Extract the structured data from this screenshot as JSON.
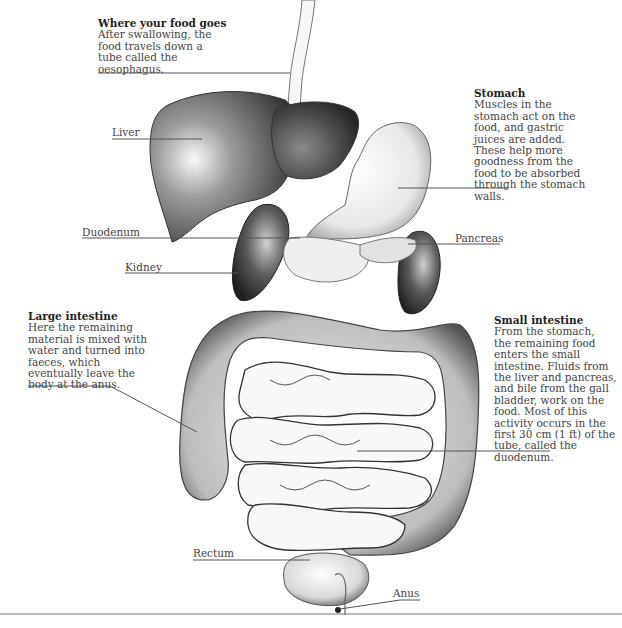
{
  "diagram": {
    "callouts": {
      "food": {
        "title": "Where your food goes",
        "body": "After swallowing, the\nfood travels down a\ntube called the\noesophagus."
      },
      "stomach": {
        "title": "Stomach",
        "body": "Muscles in the\nstomach act on the\nfood, and gastric\njuices are added.\nThese help more\ngoodness from the\nfood to be absorbed\nthrough the stomach\nwalls."
      },
      "large_intestine": {
        "title": "Large intestine",
        "body": "Here the remaining\nmaterial is mixed with\nwater and turned into\nfaeces, which\neventually leave the\nbody at the anus."
      },
      "small_intestine": {
        "title": "Small intestine",
        "body": "From the stomach,\nthe remaining food\nenters the small\nintestine. Fluids from\nthe liver and pancreas,\nand bile from the gall\nbladder, work on the\nfood. Most of this\nactivity occurs in the\nfirst 30 cm (1 ft) of the\ntube, called the\nduodenum."
      }
    },
    "labels": {
      "liver": "Liver",
      "duodenum": "Duodenum",
      "kidney": "Kidney",
      "pancreas": "Pancreas",
      "rectum": "Rectum",
      "anus": "Anus"
    },
    "colors": {
      "ink": "#333333",
      "organ_dark": "#3c3c3c",
      "organ_light": "#f4f4f4",
      "leader_line": "#555555"
    }
  }
}
